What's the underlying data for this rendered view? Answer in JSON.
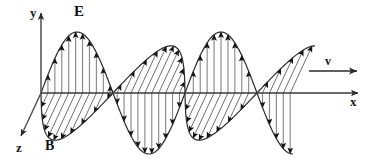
{
  "figure": {
    "width": 371,
    "height": 164,
    "background_color": "#ffffff"
  },
  "axes": {
    "origin": {
      "x": 41,
      "y": 93
    },
    "y_axis": {
      "label": "y",
      "label_x": 30,
      "label_y": 17,
      "from": {
        "x": 41,
        "y": 93
      },
      "to": {
        "x": 41,
        "y": 13
      },
      "color": "#4d4d4d"
    },
    "x_axis": {
      "label": "x",
      "label_x": 350,
      "label_y": 106,
      "from": {
        "x": 41,
        "y": 93
      },
      "to": {
        "x": 358,
        "y": 93
      },
      "color": "#3a3a3a"
    },
    "z_axis": {
      "label": "z",
      "label_x": 16,
      "label_y": 152,
      "from": {
        "x": 41,
        "y": 93
      },
      "to": {
        "x": 21,
        "y": 136
      },
      "color": "#4d4d4d"
    }
  },
  "fields": {
    "electric": {
      "symbol": "E",
      "label_x": 74,
      "label_y": 16,
      "plane": "xy",
      "shaft_color": "#8a8a8a",
      "head_color": "#111111",
      "envelope_color": "#2b2b2b",
      "amplitude": 61,
      "wavelength": 144,
      "phase_deg": 0,
      "start_x": 41,
      "end_x": 293,
      "vector_count": 36
    },
    "magnetic": {
      "symbol": "B",
      "label_x": 45,
      "label_y": 150,
      "plane": "xz",
      "shaft_color": "#555555",
      "head_color": "#111111",
      "envelope_color": "#2b2b2b",
      "amplitude": 52,
      "z_skew_x": -20,
      "z_skew_y": 43,
      "wavelength": 144,
      "phase_deg": 0,
      "start_x": 41,
      "end_x": 293,
      "vector_count": 36
    }
  },
  "propagation": {
    "symbol": "v",
    "label_x": 325,
    "label_y": 65,
    "arrow_from": {
      "x": 309,
      "y": 71
    },
    "arrow_to": {
      "x": 357,
      "y": 71
    },
    "color": "#2b2b2b"
  },
  "chart_data": {
    "type": "line",
    "xlabel": "x",
    "ylabel": "y",
    "zlabel": "z",
    "legend": [
      "E",
      "B",
      "v"
    ],
    "series": [
      {
        "name": "E",
        "orientation": "y",
        "amplitude": 1.0,
        "wavelength_px": 144,
        "cycles": 1.75,
        "description": "Electric field, vertical vectors in the x-y plane"
      },
      {
        "name": "B",
        "orientation": "z",
        "amplitude": 0.85,
        "wavelength_px": 144,
        "cycles": 1.75,
        "description": "Magnetic field, vectors along z, in phase with E"
      }
    ],
    "annotations": [
      "E",
      "B",
      "v",
      "x",
      "y",
      "z"
    ],
    "grid": false,
    "xlim": [
      41,
      358
    ],
    "ylim": [
      -61,
      61
    ]
  }
}
